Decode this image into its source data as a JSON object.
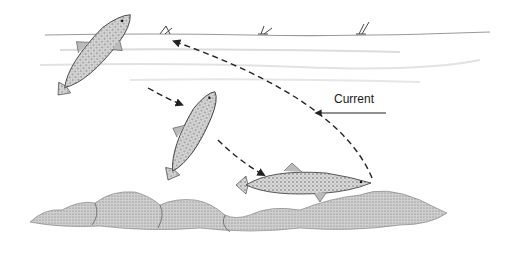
{
  "illustration": {
    "subject": "trout rising to take a surface fly, then returning to the bottom",
    "label": {
      "text": "Current"
    },
    "colors": {
      "ink": "#222222",
      "water_line": "#9a9a9a",
      "rock": "#8a8a8a",
      "background": "#ffffff"
    }
  }
}
